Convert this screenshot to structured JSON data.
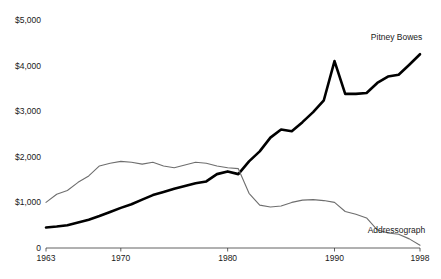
{
  "chart_data": {
    "type": "line",
    "title": "",
    "subtitle": "",
    "xlabel": "",
    "ylabel": "",
    "xlim": [
      1963,
      1998
    ],
    "ylim": [
      0,
      5000
    ],
    "grid": false,
    "legend_position": "inline-end-of-line",
    "y_ticks": [
      {
        "value": 5000,
        "label": "$5,000"
      },
      {
        "value": 4000,
        "label": "$4,000"
      },
      {
        "value": 3000,
        "label": "$3,000"
      },
      {
        "value": 2000,
        "label": "$2,000"
      },
      {
        "value": 1000,
        "label": "$1,000"
      },
      {
        "value": 0,
        "label": "0"
      }
    ],
    "x_ticks": [
      {
        "value": 1963,
        "label": "1963"
      },
      {
        "value": 1970,
        "label": "1970"
      },
      {
        "value": 1980,
        "label": "1980"
      },
      {
        "value": 1990,
        "label": "1990"
      },
      {
        "value": 1998,
        "label": "1998"
      }
    ],
    "x": [
      1963,
      1964,
      1965,
      1966,
      1967,
      1968,
      1969,
      1970,
      1971,
      1972,
      1973,
      1974,
      1975,
      1976,
      1977,
      1978,
      1979,
      1980,
      1981,
      1982,
      1983,
      1984,
      1985,
      1986,
      1987,
      1988,
      1989,
      1990,
      1991,
      1992,
      1993,
      1994,
      1995,
      1996,
      1997,
      1998
    ],
    "series": [
      {
        "name": "Pitney Bowes",
        "color": "#000000",
        "style": "thick-black",
        "label_x": 1993.4,
        "label_y": 4560,
        "values": [
          450,
          470,
          500,
          560,
          620,
          700,
          790,
          880,
          960,
          1060,
          1160,
          1230,
          1300,
          1360,
          1420,
          1460,
          1620,
          1680,
          1620,
          1900,
          2120,
          2420,
          2600,
          2560,
          2760,
          2980,
          3240,
          4100,
          3380,
          3380,
          3400,
          3620,
          3760,
          3800,
          4020,
          4250
        ]
      },
      {
        "name": "Addressograph",
        "color": "#6e6e6e",
        "style": "thin-gray",
        "label_x": 1993.1,
        "label_y": 330,
        "values": [
          1000,
          1180,
          1260,
          1440,
          1580,
          1800,
          1860,
          1900,
          1880,
          1840,
          1880,
          1800,
          1760,
          1820,
          1880,
          1860,
          1800,
          1760,
          1740,
          1200,
          940,
          900,
          920,
          1000,
          1050,
          1060,
          1040,
          1000,
          800,
          740,
          660,
          400,
          330,
          300,
          200,
          60
        ]
      }
    ]
  }
}
